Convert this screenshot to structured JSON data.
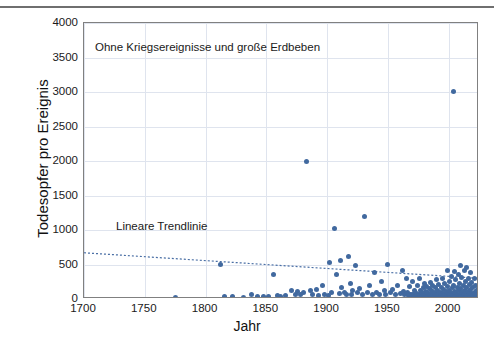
{
  "chart_data": {
    "type": "scatter",
    "title": "",
    "annotation": "Ohne Kriegsereignisse und große Erdbeben",
    "trendline_label": "Lineare Trendlinie",
    "xlabel": "Jahr",
    "ylabel": "Todesopfer pro Ereignis",
    "xlim": [
      1700,
      2025
    ],
    "ylim": [
      0,
      4000
    ],
    "xticks": [
      1700,
      1750,
      1800,
      1850,
      1900,
      1950,
      2000
    ],
    "yticks": [
      0,
      500,
      1000,
      1500,
      2000,
      2500,
      3000,
      3500,
      4000
    ],
    "grid": true,
    "legend": "none",
    "marker_color": "#41699f",
    "trendline_color": "#4a6fa5",
    "trendline": {
      "style": "dotted",
      "x_start": 1700,
      "y_start": 670,
      "x_end": 2025,
      "y_end": 300
    },
    "series": [
      {
        "name": "Todesopfer pro Ereignis",
        "points": [
          [
            1775,
            20
          ],
          [
            1812,
            500
          ],
          [
            1816,
            40
          ],
          [
            1822,
            30
          ],
          [
            1831,
            25
          ],
          [
            1838,
            60
          ],
          [
            1843,
            35
          ],
          [
            1848,
            30
          ],
          [
            1852,
            40
          ],
          [
            1856,
            350
          ],
          [
            1859,
            50
          ],
          [
            1862,
            30
          ],
          [
            1866,
            45
          ],
          [
            1871,
            120
          ],
          [
            1874,
            60
          ],
          [
            1876,
            110
          ],
          [
            1878,
            70
          ],
          [
            1881,
            90
          ],
          [
            1883,
            2000
          ],
          [
            1886,
            120
          ],
          [
            1888,
            60
          ],
          [
            1891,
            140
          ],
          [
            1893,
            45
          ],
          [
            1896,
            200
          ],
          [
            1898,
            70
          ],
          [
            1901,
            55
          ],
          [
            1902,
            530
          ],
          [
            1904,
            90
          ],
          [
            1906,
            1020
          ],
          [
            1908,
            350
          ],
          [
            1910,
            80
          ],
          [
            1911,
            560
          ],
          [
            1912,
            160
          ],
          [
            1914,
            100
          ],
          [
            1916,
            70
          ],
          [
            1918,
            610
          ],
          [
            1919,
            220
          ],
          [
            1920,
            60
          ],
          [
            1921,
            120
          ],
          [
            1923,
            480
          ],
          [
            1925,
            90
          ],
          [
            1927,
            150
          ],
          [
            1929,
            60
          ],
          [
            1931,
            1200
          ],
          [
            1933,
            90
          ],
          [
            1935,
            200
          ],
          [
            1937,
            60
          ],
          [
            1939,
            380
          ],
          [
            1941,
            100
          ],
          [
            1943,
            60
          ],
          [
            1945,
            250
          ],
          [
            1947,
            120
          ],
          [
            1948,
            70
          ],
          [
            1950,
            500
          ],
          [
            1952,
            90
          ],
          [
            1954,
            140
          ],
          [
            1956,
            60
          ],
          [
            1958,
            200
          ],
          [
            1960,
            80
          ],
          [
            1962,
            420
          ],
          [
            1963,
            110
          ],
          [
            1964,
            60
          ],
          [
            1965,
            300
          ],
          [
            1966,
            90
          ],
          [
            1967,
            50
          ],
          [
            1968,
            180
          ],
          [
            1969,
            70
          ],
          [
            1970,
            260
          ],
          [
            1970,
            60
          ],
          [
            1971,
            30
          ],
          [
            1972,
            120
          ],
          [
            1972,
            40
          ],
          [
            1973,
            90
          ],
          [
            1974,
            200
          ],
          [
            1974,
            50
          ],
          [
            1975,
            70
          ],
          [
            1976,
            300
          ],
          [
            1976,
            40
          ],
          [
            1977,
            130
          ],
          [
            1977,
            60
          ],
          [
            1978,
            90
          ],
          [
            1978,
            30
          ],
          [
            1979,
            160
          ],
          [
            1979,
            50
          ],
          [
            1980,
            220
          ],
          [
            1980,
            70
          ],
          [
            1981,
            40
          ],
          [
            1981,
            110
          ],
          [
            1982,
            60
          ],
          [
            1982,
            180
          ],
          [
            1983,
            30
          ],
          [
            1983,
            90
          ],
          [
            1984,
            150
          ],
          [
            1984,
            50
          ],
          [
            1985,
            240
          ],
          [
            1985,
            70
          ],
          [
            1986,
            40
          ],
          [
            1986,
            120
          ],
          [
            1987,
            60
          ],
          [
            1987,
            200
          ],
          [
            1988,
            35
          ],
          [
            1988,
            95
          ],
          [
            1989,
            160
          ],
          [
            1989,
            55
          ],
          [
            1990,
            280
          ],
          [
            1990,
            70
          ],
          [
            1991,
            45
          ],
          [
            1991,
            130
          ],
          [
            1992,
            65
          ],
          [
            1992,
            210
          ],
          [
            1993,
            40
          ],
          [
            1993,
            100
          ],
          [
            1994,
            170
          ],
          [
            1994,
            55
          ],
          [
            1995,
            300
          ],
          [
            1995,
            75
          ],
          [
            1996,
            45
          ],
          [
            1996,
            140
          ],
          [
            1997,
            60
          ],
          [
            1997,
            230
          ],
          [
            1998,
            35
          ],
          [
            1998,
            105
          ],
          [
            1999,
            420
          ],
          [
            1999,
            180
          ],
          [
            1999,
            60
          ],
          [
            2000,
            90
          ],
          [
            2000,
            40
          ],
          [
            2001,
            250
          ],
          [
            2001,
            130
          ],
          [
            2001,
            55
          ],
          [
            2002,
            330
          ],
          [
            2002,
            75
          ],
          [
            2003,
            45
          ],
          [
            2003,
            160
          ],
          [
            2004,
            3010
          ],
          [
            2004,
            200
          ],
          [
            2004,
            60
          ],
          [
            2005,
            400
          ],
          [
            2005,
            110
          ],
          [
            2005,
            40
          ],
          [
            2006,
            280
          ],
          [
            2006,
            90
          ],
          [
            2007,
            50
          ],
          [
            2007,
            170
          ],
          [
            2008,
            350
          ],
          [
            2008,
            120
          ],
          [
            2008,
            45
          ],
          [
            2009,
            230
          ],
          [
            2009,
            70
          ],
          [
            2010,
            480
          ],
          [
            2010,
            150
          ],
          [
            2010,
            55
          ],
          [
            2011,
            310
          ],
          [
            2011,
            95
          ],
          [
            2012,
            40
          ],
          [
            2012,
            190
          ],
          [
            2013,
            420
          ],
          [
            2013,
            130
          ],
          [
            2013,
            60
          ],
          [
            2014,
            260
          ],
          [
            2014,
            80
          ],
          [
            2015,
            450
          ],
          [
            2015,
            170
          ],
          [
            2015,
            50
          ],
          [
            2016,
            300
          ],
          [
            2016,
            110
          ],
          [
            2017,
            65
          ],
          [
            2017,
            210
          ],
          [
            2018,
            380
          ],
          [
            2018,
            140
          ],
          [
            2018,
            45
          ],
          [
            2019,
            240
          ],
          [
            2019,
            85
          ],
          [
            2020,
            160
          ],
          [
            2020,
            55
          ],
          [
            2021,
            300
          ],
          [
            2021,
            100
          ],
          [
            2022,
            60
          ],
          [
            2022,
            200
          ],
          [
            2023,
            130
          ],
          [
            2023,
            40
          ]
        ]
      }
    ]
  }
}
